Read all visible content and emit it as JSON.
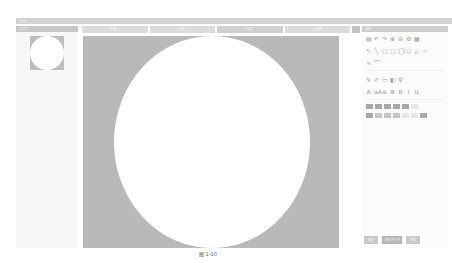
{
  "window": {
    "title": "Paint"
  },
  "left_panel": {
    "title": "幻灯片"
  },
  "steps": [
    {
      "label": "步骤一"
    },
    {
      "label": "步骤二"
    },
    {
      "label": "步骤三"
    },
    {
      "label": "步骤四"
    }
  ],
  "right_panel": {
    "title": "编辑",
    "toolbar_rows": [
      [
        "file-icon",
        "undo-icon",
        "redo-icon",
        "zoom-in-icon",
        "zoom-out-icon",
        "settings-icon",
        "grid-icon"
      ],
      [
        "select-icon",
        "line-icon",
        "rect-icon",
        "rounded-rect-icon",
        "ellipse-icon",
        "polygon-icon",
        "triangle-icon",
        "star-icon"
      ],
      [
        "curve-icon",
        "arc-icon"
      ],
      [
        "pen-icon",
        "brush-icon",
        "eraser-icon",
        "fill-icon",
        "eyedropper-icon"
      ],
      [
        "text-icon",
        "font-size-icon",
        "align-left-icon",
        "align-center-icon",
        "bold-icon",
        "italic-icon",
        "underline-icon"
      ]
    ],
    "glyphs": {
      "file-icon": "▤",
      "undo-icon": "↶",
      "redo-icon": "↷",
      "zoom-in-icon": "⊕",
      "zoom-out-icon": "⊖",
      "settings-icon": "⚙",
      "grid-icon": "▦",
      "select-icon": "↖",
      "line-icon": "╲",
      "rect-icon": "□",
      "rounded-rect-icon": "▢",
      "ellipse-icon": "◯",
      "polygon-icon": "⬠",
      "triangle-icon": "△",
      "star-icon": "☆",
      "curve-icon": "∿",
      "arc-icon": "⌒",
      "pen-icon": "✎",
      "brush-icon": "✐",
      "eraser-icon": "▭",
      "fill-icon": "◧",
      "eyedropper-icon": "⚲",
      "text-icon": "A",
      "font-size-icon": "aA",
      "align-left-icon": "≡",
      "align-center-icon": "≣",
      "bold-icon": "B",
      "italic-icon": "I",
      "underline-icon": "U"
    },
    "swatch_rows": [
      [
        "dark",
        "dark",
        "dark",
        "dark",
        "dark",
        "light"
      ],
      [
        "dark",
        "mid",
        "mid",
        "mid",
        "light",
        "light",
        "dark"
      ]
    ]
  },
  "buttons": [
    {
      "label": "确定",
      "width": 14
    },
    {
      "label": "保存为文件",
      "width": 20,
      "style": "dark"
    },
    {
      "label": "取消",
      "width": 14
    }
  ],
  "caption": "图 1-10"
}
